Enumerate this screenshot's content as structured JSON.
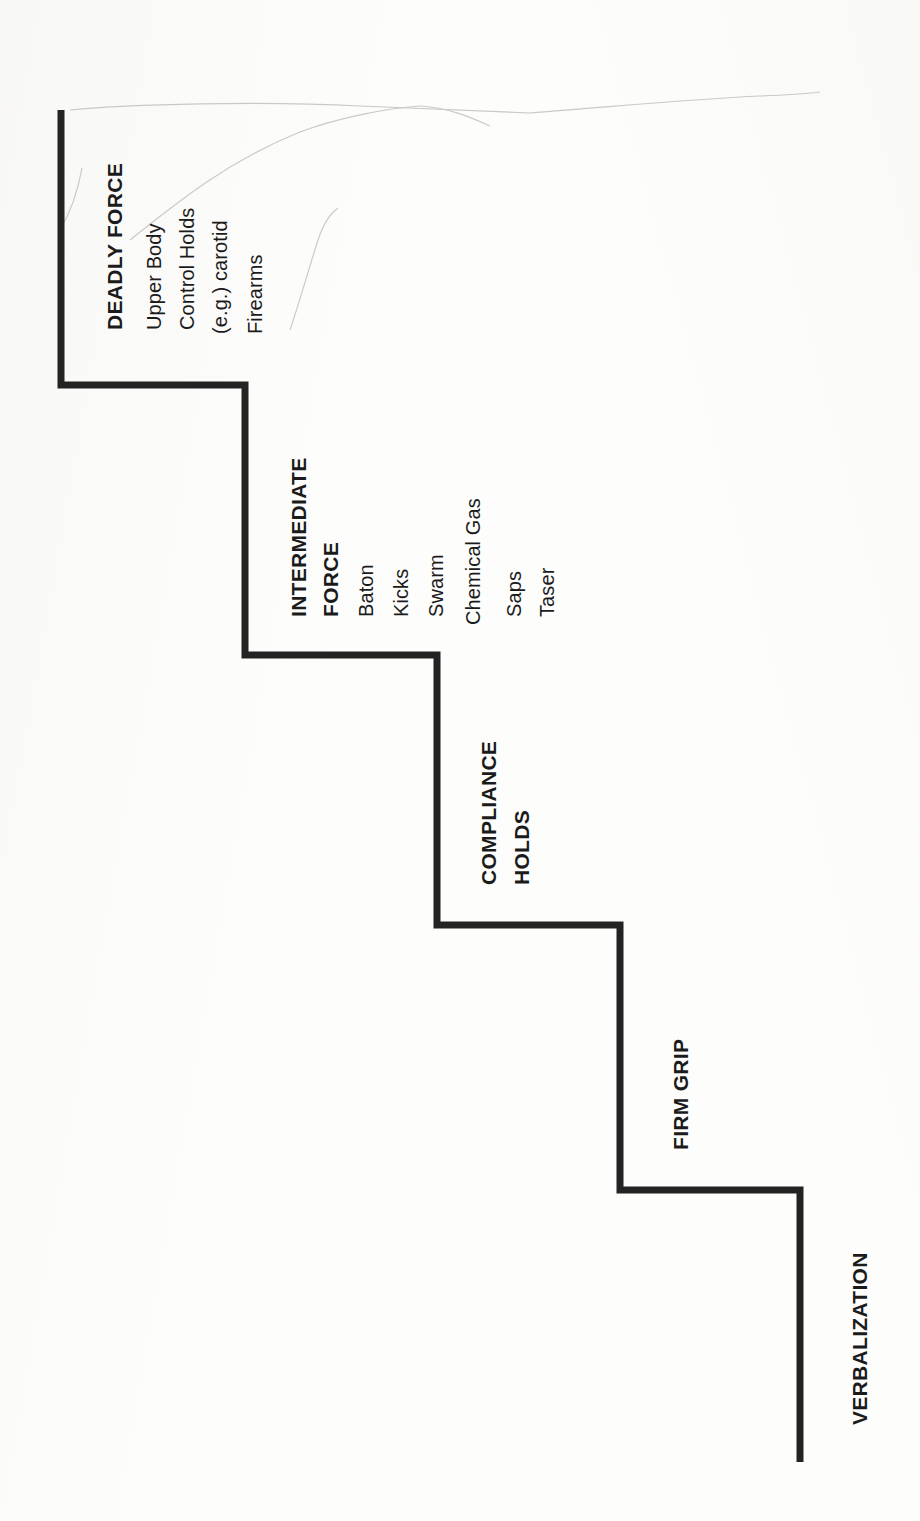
{
  "document": {
    "kind": "scanned-diagram",
    "title_visible": false,
    "orientation": "rotated-90-counterclockwise",
    "ink_color": "#1b1b1b",
    "paper_color": "#fdfdfc",
    "stroke_color": "#232323"
  },
  "diagram": {
    "type": "staircase-escalation",
    "step_count": 5,
    "tiers": [
      {
        "id": "deadly-force",
        "heading_lines": [
          "DEADLY FORCE"
        ],
        "items": [
          "Upper Body",
          "Control Holds",
          "(e.g.) carotid",
          "Firearms"
        ]
      },
      {
        "id": "intermediate-force",
        "heading_lines": [
          "INTERMEDIATE",
          "FORCE"
        ],
        "items": [
          "Baton",
          "Kicks",
          "Swarm",
          "Chemical Gas",
          "Saps",
          "Taser"
        ]
      },
      {
        "id": "compliance-holds",
        "heading_lines": [
          "COMPLIANCE",
          "HOLDS"
        ],
        "items": []
      },
      {
        "id": "firm-grip",
        "heading_lines": [
          "FIRM GRIP"
        ],
        "items": []
      },
      {
        "id": "verbalization",
        "heading_lines": [
          "VERBALIZATION"
        ],
        "items": []
      }
    ]
  },
  "artifacts": {
    "smudge_note": "faint pencil / scanner streak lines across upper area",
    "streak_count": 5
  }
}
